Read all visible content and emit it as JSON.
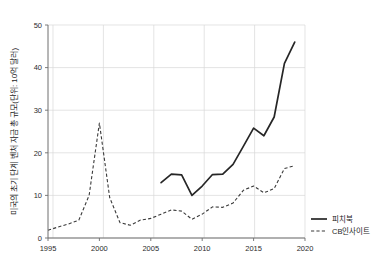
{
  "chart_data": {
    "type": "line",
    "title": "",
    "xlabel": "",
    "ylabel": "미국의 초기 단계 벤처 자금 총 규모(단위: 10억 달러)",
    "xlim": [
      1995,
      2020
    ],
    "ylim": [
      0,
      50
    ],
    "xticks": [
      "1995",
      "2000",
      "2005",
      "2010",
      "2015",
      "2020"
    ],
    "xtick_values": [
      1995,
      2000,
      2005,
      2010,
      2015,
      2020
    ],
    "yticks": [
      "0",
      "10",
      "20",
      "30",
      "40",
      "50"
    ],
    "ytick_values": [
      0,
      10,
      20,
      30,
      40,
      50
    ],
    "grid": true,
    "legend_position": "right-bottom",
    "series": [
      {
        "name": "피치북",
        "style": "solid",
        "color": "#262626",
        "x": [
          2006,
          2007,
          2008,
          2009,
          2010,
          2011,
          2012,
          2013,
          2014,
          2015,
          2016,
          2017,
          2018,
          2019
        ],
        "values": [
          13.0,
          15.0,
          14.8,
          10.0,
          12.2,
          14.9,
          15.0,
          17.3,
          21.5,
          25.8,
          24.0,
          28.4,
          41.0,
          46.0
        ]
      },
      {
        "name": "CB인사이트",
        "style": "dashed",
        "color": "#3a3a3a",
        "x": [
          1995,
          1996,
          1997,
          1998,
          1999,
          2000,
          2001,
          2002,
          2003,
          2004,
          2005,
          2006,
          2007,
          2008,
          2009,
          2010,
          2011,
          2012,
          2013,
          2014,
          2015,
          2016,
          2017,
          2018,
          2019
        ],
        "values": [
          1.8,
          2.6,
          3.3,
          4.2,
          10.0,
          27.0,
          9.5,
          3.6,
          3.0,
          4.2,
          4.6,
          5.6,
          6.6,
          6.3,
          4.4,
          5.6,
          7.3,
          7.2,
          8.2,
          11.2,
          12.2,
          10.6,
          11.6,
          16.3,
          17.0
        ]
      }
    ]
  },
  "axes": {
    "y_axis_title": "미국의 초기 단계 벤처 자금 총 규모(단위: 10억 달러)"
  },
  "legend": {
    "entries": [
      {
        "label": "피치북",
        "style": "solid"
      },
      {
        "label": "CB인사이트",
        "style": "dashed"
      }
    ]
  }
}
